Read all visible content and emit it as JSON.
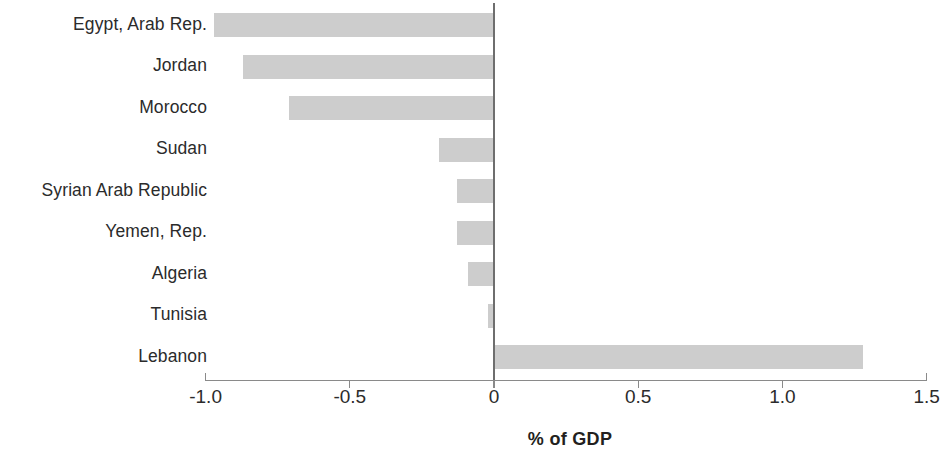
{
  "chart_data": {
    "type": "bar",
    "orientation": "horizontal",
    "title": "",
    "xlabel": "% of GDP",
    "ylabel": "",
    "xlim": [
      -1.0,
      1.5
    ],
    "xticks": [
      -1.0,
      -0.5,
      0,
      0.5,
      1.0,
      1.5
    ],
    "xtick_labels": [
      "-1.0",
      "-0.5",
      "0",
      "0.5",
      "1.0",
      "1.5"
    ],
    "grid": false,
    "legend": null,
    "bar_color": "#cdcdcd",
    "axis_color": "#8a8a8a",
    "zero_line_color": "#6e6e6e",
    "categories": [
      "Egypt, Arab Rep.",
      "Jordan",
      "Morocco",
      "Sudan",
      "Syrian Arab Republic",
      "Yemen, Rep.",
      "Algeria",
      "Tunisia",
      "Lebanon"
    ],
    "values": [
      -0.97,
      -0.87,
      -0.71,
      -0.19,
      -0.13,
      -0.13,
      -0.09,
      -0.02,
      1.28
    ],
    "series": [
      {
        "name": "",
        "values": [
          -0.97,
          -0.87,
          -0.71,
          -0.19,
          -0.13,
          -0.13,
          -0.09,
          -0.02,
          1.28
        ]
      }
    ]
  },
  "layout": {
    "plot_left_px": 205,
    "plot_right_px": 926,
    "zero_px": 494,
    "px_per_unit": 288.4,
    "first_bar_top_px": 13,
    "bar_pitch_px": 41.5,
    "bar_height_px": 24,
    "axis_y_px": 380,
    "tick_label_y_px": 387,
    "axis_title_x_px": 570,
    "axis_title_y_px": 430,
    "label_right_px": 207,
    "label_font_px": 17.5
  }
}
